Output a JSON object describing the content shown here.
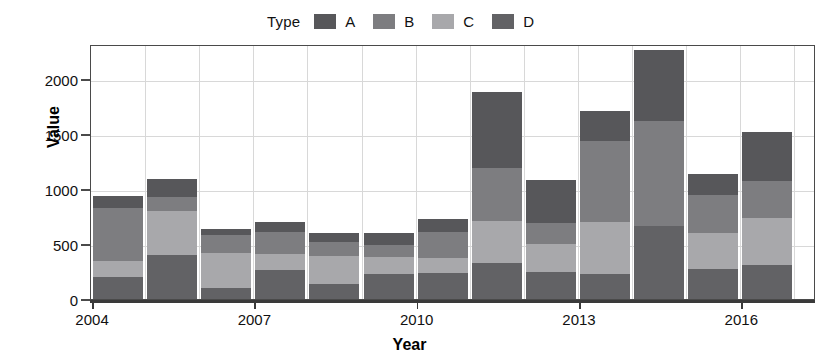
{
  "chart_data": {
    "type": "bar",
    "stacked": true,
    "title": "",
    "xlabel": "Year",
    "ylabel": "Value",
    "legend_title": "Type",
    "legend_position": "top",
    "grid": true,
    "categories": [
      2004,
      2005,
      2006,
      2007,
      2008,
      2009,
      2010,
      2011,
      2012,
      2013,
      2014,
      2015,
      2016
    ],
    "xticks": [
      "2004",
      "2007",
      "2010",
      "2013",
      "2016"
    ],
    "xtick_values": [
      2004,
      2007,
      2010,
      2013,
      2016
    ],
    "yticks": [
      "0",
      "500",
      "1000",
      "1500",
      "2000"
    ],
    "ytick_values": [
      0,
      500,
      1000,
      1500,
      2000
    ],
    "ylim": [
      0,
      2320
    ],
    "xlim": [
      2003.5,
      2016.9
    ],
    "series": [
      {
        "name": "A",
        "color": "#57575a",
        "values": [
          110,
          160,
          55,
          90,
          80,
          110,
          120,
          690,
          390,
          280,
          650,
          190,
          450
        ]
      },
      {
        "name": "B",
        "color": "#7d7d80",
        "values": [
          480,
          130,
          160,
          200,
          130,
          110,
          240,
          480,
          195,
          730,
          960,
          340,
          330
        ]
      },
      {
        "name": "C",
        "color": "#a8a8ab",
        "values": [
          150,
          400,
          320,
          150,
          250,
          155,
          130,
          380,
          250,
          480,
          0,
          330,
          430
        ]
      },
      {
        "name": "D",
        "color": "#626265",
        "values": [
          200,
          400,
          100,
          260,
          140,
          230,
          240,
          330,
          250,
          225,
          660,
          275,
          310
        ]
      }
    ],
    "stack_order": [
      "D",
      "C",
      "B",
      "A"
    ],
    "totals": [
      940,
      1090,
      635,
      700,
      600,
      605,
      730,
      1880,
      1085,
      1715,
      2270,
      1135,
      1520
    ]
  },
  "legend": {
    "title": "Type",
    "items": [
      {
        "label": "A",
        "color": "#57575a"
      },
      {
        "label": "B",
        "color": "#7d7d80"
      },
      {
        "label": "C",
        "color": "#a8a8ab"
      },
      {
        "label": "D",
        "color": "#626265"
      }
    ]
  },
  "colors": {
    "frame": "#4a4a4a",
    "grid": "#d8d8d8",
    "axis": "#3a3a3a",
    "text": "#111111",
    "background": "#ffffff"
  }
}
